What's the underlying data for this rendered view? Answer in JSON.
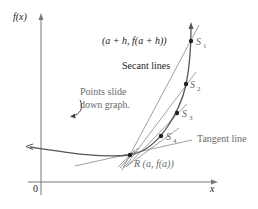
{
  "figure": {
    "axes": {
      "y_label": "f(x)",
      "x_label": "x",
      "origin_label": "0"
    },
    "labels": {
      "secant_point": "(a + h, f(a + h))",
      "secant_lines": "Secant lines",
      "points_slide_line1": "Points slide",
      "points_slide_line2": "down graph.",
      "tangent_line": "Tangent line",
      "R_point": "R (a, f(a))"
    },
    "points": [
      {
        "name": "S",
        "sub": "1"
      },
      {
        "name": "S",
        "sub": "2"
      },
      {
        "name": "S",
        "sub": "3"
      },
      {
        "name": "S",
        "sub": "4"
      }
    ],
    "colors": {
      "curve": "#555555",
      "axes": "#777777",
      "lines": "#8a8a8a",
      "text": "#1a1a1a",
      "annotation": "#6a6a6a"
    }
  }
}
